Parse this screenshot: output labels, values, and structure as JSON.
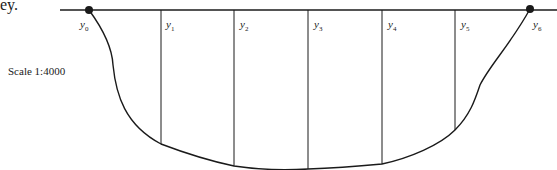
{
  "caption_fragment": "ey.",
  "scale_label": "Scale 1:4000",
  "offset_labels": [
    {
      "base": "y",
      "sub": "0"
    },
    {
      "base": "y",
      "sub": "1"
    },
    {
      "base": "y",
      "sub": "2"
    },
    {
      "base": "y",
      "sub": "3"
    },
    {
      "base": "y",
      "sub": "4"
    },
    {
      "base": "y",
      "sub": "5"
    },
    {
      "base": "y",
      "sub": "6"
    }
  ],
  "colors": {
    "ink": "#1a1a1a"
  }
}
